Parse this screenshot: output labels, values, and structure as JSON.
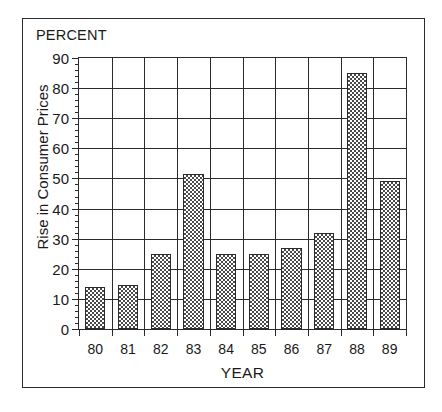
{
  "chart_data": {
    "type": "bar",
    "title": "",
    "unit_label": "PERCENT",
    "xlabel": "YEAR",
    "ylabel": "Rise in Consumer Prices",
    "categories": [
      "80",
      "81",
      "82",
      "83",
      "84",
      "85",
      "86",
      "87",
      "88",
      "89"
    ],
    "values": [
      14,
      14.5,
      25,
      51.5,
      25,
      25,
      27,
      32,
      85,
      49
    ],
    "ylim": [
      0,
      90
    ],
    "ytick_labels": [
      "0",
      "10",
      "20",
      "30",
      "40",
      "50",
      "60",
      "70",
      "80",
      "90"
    ],
    "ytick_values": [
      0,
      10,
      20,
      30,
      40,
      50,
      60,
      70,
      80,
      90
    ],
    "yminor_step": 2,
    "grid": "both",
    "legend": "none",
    "bar_fill": "checkerboard-hatch",
    "bar_edge_color": "#2b2b2b",
    "axis_color": "#2b2b2b",
    "background_color": "#ffffff"
  }
}
